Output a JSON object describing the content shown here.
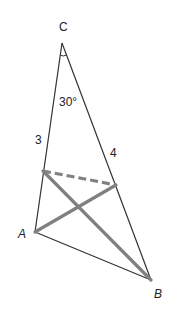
{
  "diagram": {
    "type": "triangle",
    "vertices": {
      "C": {
        "label": "C",
        "x": 62,
        "y": 43
      },
      "A": {
        "label": "A",
        "x": 35,
        "y": 232
      },
      "B": {
        "label": "B",
        "x": 151,
        "y": 280
      }
    },
    "points_on_sides": {
      "P_on_CA": {
        "x": 43,
        "y": 171
      },
      "Q_on_CB": {
        "x": 116,
        "y": 185
      }
    },
    "labels": {
      "C": "C",
      "A": "A",
      "B": "B",
      "angle_C": "30°",
      "side_CP": "3",
      "side_CQ": "4"
    },
    "segments": [
      {
        "from": "C",
        "to": "A",
        "style": "thin"
      },
      {
        "from": "C",
        "to": "B",
        "style": "thin"
      },
      {
        "from": "A",
        "to": "B",
        "style": "thin"
      },
      {
        "from": "P_on_CA",
        "to": "Q_on_CB",
        "style": "thick-dashed"
      },
      {
        "from": "A",
        "to": "Q_on_CB",
        "style": "thick"
      },
      {
        "from": "P_on_CA",
        "to": "B",
        "style": "thick"
      }
    ],
    "colors": {
      "thin_line": "#333333",
      "thick_line": "#808080",
      "text": "#222222"
    }
  }
}
